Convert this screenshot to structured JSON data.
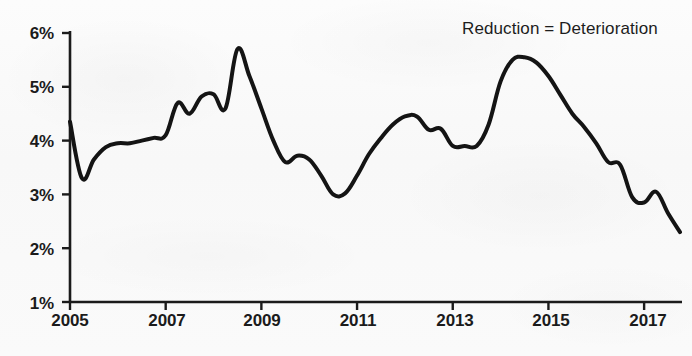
{
  "chart_data": {
    "type": "line",
    "title": "",
    "subtitle": "",
    "xlabel": "",
    "ylabel": "",
    "annotations": [
      {
        "name": "reduction-deterioration-note",
        "text": "Reduction = Deterioration",
        "x_px": 462,
        "y_px": 19
      }
    ],
    "legend": [],
    "legend_position": "none",
    "grid": false,
    "axis_color": "#1b1b1b",
    "line_color": "#141414",
    "line_width_px": 4,
    "background_color": "#fafafa",
    "xlim": [
      2005.0,
      2017.75
    ],
    "ylim": [
      1,
      6
    ],
    "ytick_labels": [
      "6%",
      "5%",
      "4%",
      "3%",
      "2%",
      "1%"
    ],
    "ytick_values": [
      6,
      5,
      4,
      3,
      2,
      1
    ],
    "xtick_labels": [
      "2005",
      "2007",
      "2009",
      "2011",
      "2013",
      "2015",
      "2017"
    ],
    "xtick_values": [
      2005,
      2007,
      2009,
      2011,
      2013,
      2015,
      2017
    ],
    "series": [
      {
        "name": "rate",
        "units": "percent",
        "x": [
          2005.0,
          2005.25,
          2005.5,
          2005.75,
          2006.0,
          2006.25,
          2006.5,
          2006.75,
          2007.0,
          2007.25,
          2007.5,
          2007.75,
          2008.0,
          2008.25,
          2008.5,
          2008.75,
          2009.0,
          2009.25,
          2009.5,
          2009.75,
          2010.0,
          2010.25,
          2010.5,
          2010.75,
          2011.0,
          2011.25,
          2011.5,
          2011.75,
          2012.0,
          2012.25,
          2012.5,
          2012.75,
          2013.0,
          2013.25,
          2013.5,
          2013.75,
          2014.0,
          2014.25,
          2014.5,
          2014.75,
          2015.0,
          2015.25,
          2015.5,
          2015.75,
          2016.0,
          2016.25,
          2016.5,
          2016.75,
          2017.0,
          2017.25,
          2017.5,
          2017.75
        ],
        "values": [
          4.35,
          3.3,
          3.65,
          3.88,
          3.95,
          3.95,
          4.0,
          4.05,
          4.1,
          4.7,
          4.5,
          4.82,
          4.86,
          4.6,
          5.7,
          5.2,
          4.6,
          4.0,
          3.6,
          3.72,
          3.65,
          3.35,
          3.0,
          3.02,
          3.35,
          3.75,
          4.05,
          4.3,
          4.45,
          4.45,
          4.2,
          4.22,
          3.9,
          3.9,
          3.9,
          4.3,
          5.1,
          5.5,
          5.55,
          5.45,
          5.2,
          4.85,
          4.5,
          4.25,
          3.95,
          3.6,
          3.55,
          2.95,
          2.85,
          3.05,
          2.65,
          2.3
        ]
      }
    ]
  },
  "axes": {
    "y_axis_name": "percent-axis",
    "x_axis_name": "year-axis"
  }
}
